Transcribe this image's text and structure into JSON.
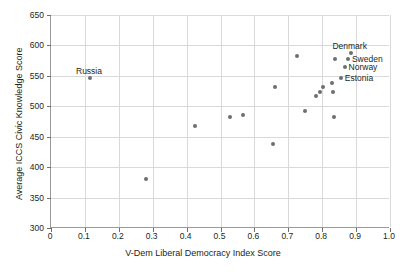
{
  "chart_data": {
    "type": "scatter",
    "title": "",
    "xlabel": "V-Dem Liberal Democracy Index Score",
    "ylabel": "Average ICCS Civic Knowledge Score",
    "xlim": [
      0,
      1.0
    ],
    "ylim": [
      300,
      650
    ],
    "xticks": [
      "0",
      "0.1",
      "0.2",
      "0.3",
      "0.4",
      "0.5",
      "0.6",
      "0.7",
      "0.8",
      "0.9",
      "1.0"
    ],
    "xtick_values": [
      0,
      0.1,
      0.2,
      0.3,
      0.4,
      0.5,
      0.6,
      0.7,
      0.8,
      0.9,
      1.0
    ],
    "yticks": [
      "300",
      "350",
      "400",
      "450",
      "500",
      "550",
      "600",
      "650"
    ],
    "ytick_values": [
      300,
      350,
      400,
      450,
      500,
      550,
      600,
      650
    ],
    "grid": true,
    "legend": "none",
    "point_color": "#6d6e71",
    "grid_color": "#d9d9d9",
    "axis_color": "#9a9a9a",
    "points": [
      {
        "x": 0.115,
        "y": 546,
        "label": "Russia",
        "label_pos": "above"
      },
      {
        "x": 0.281,
        "y": 381,
        "label": "",
        "label_pos": ""
      },
      {
        "x": 0.424,
        "y": 467,
        "label": "",
        "label_pos": ""
      },
      {
        "x": 0.529,
        "y": 482,
        "label": "",
        "label_pos": ""
      },
      {
        "x": 0.566,
        "y": 485,
        "label": "",
        "label_pos": ""
      },
      {
        "x": 0.655,
        "y": 438,
        "label": "",
        "label_pos": ""
      },
      {
        "x": 0.66,
        "y": 531,
        "label": "",
        "label_pos": ""
      },
      {
        "x": 0.727,
        "y": 582,
        "label": "",
        "label_pos": ""
      },
      {
        "x": 0.748,
        "y": 493,
        "label": "",
        "label_pos": ""
      },
      {
        "x": 0.781,
        "y": 517,
        "label": "",
        "label_pos": ""
      },
      {
        "x": 0.793,
        "y": 524,
        "label": "",
        "label_pos": ""
      },
      {
        "x": 0.803,
        "y": 532,
        "label": "",
        "label_pos": ""
      },
      {
        "x": 0.828,
        "y": 538,
        "label": "",
        "label_pos": ""
      },
      {
        "x": 0.833,
        "y": 523,
        "label": "",
        "label_pos": ""
      },
      {
        "x": 0.836,
        "y": 482,
        "label": "",
        "label_pos": ""
      },
      {
        "x": 0.838,
        "y": 577,
        "label": "",
        "label_pos": ""
      },
      {
        "x": 0.855,
        "y": 547,
        "label": "Estonia",
        "label_pos": "right"
      },
      {
        "x": 0.866,
        "y": 565,
        "label": "Norway",
        "label_pos": "right"
      },
      {
        "x": 0.876,
        "y": 577,
        "label": "Sweden",
        "label_pos": "right"
      },
      {
        "x": 0.884,
        "y": 588,
        "label": "Denmark",
        "label_pos": "above"
      }
    ]
  }
}
